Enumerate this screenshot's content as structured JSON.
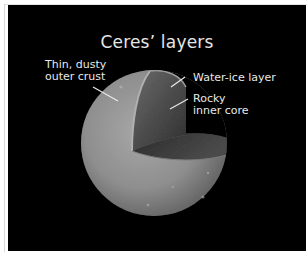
{
  "diagram": {
    "title": "Ceres’ layers",
    "labels": {
      "crust": {
        "line1": "Thin, dusty",
        "line2": "outer crust"
      },
      "ice": {
        "line1": "Water-ice layer"
      },
      "core": {
        "line1": "Rocky",
        "line2": "inner core"
      }
    },
    "colors": {
      "background": "#000000",
      "text": "#e8e8e8",
      "surface": "#9a9a9a",
      "ice_face": "#5a5a5a",
      "core_face": "#3a3a3a",
      "leader_line": "#e8e8e8"
    }
  }
}
